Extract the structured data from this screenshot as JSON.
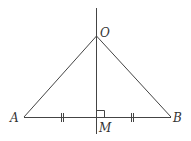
{
  "diagram": {
    "type": "geometry",
    "points": {
      "O": {
        "label": "O",
        "x": 96,
        "y": 36
      },
      "A": {
        "label": "A",
        "x": 24,
        "y": 117
      },
      "B": {
        "label": "B",
        "x": 171,
        "y": 117
      },
      "M": {
        "label": "M",
        "x": 96,
        "y": 117
      }
    },
    "segments": [
      "OA",
      "OB",
      "AB"
    ],
    "lines": [
      {
        "name": "perpendicular-bisector",
        "through": [
          "O",
          "M"
        ]
      }
    ],
    "marks": {
      "equal_ticks": [
        "AM",
        "MB"
      ],
      "right_angle": "at M"
    },
    "colors": {
      "stroke": "#444444",
      "text": "#333333",
      "background": "#ffffff"
    }
  }
}
